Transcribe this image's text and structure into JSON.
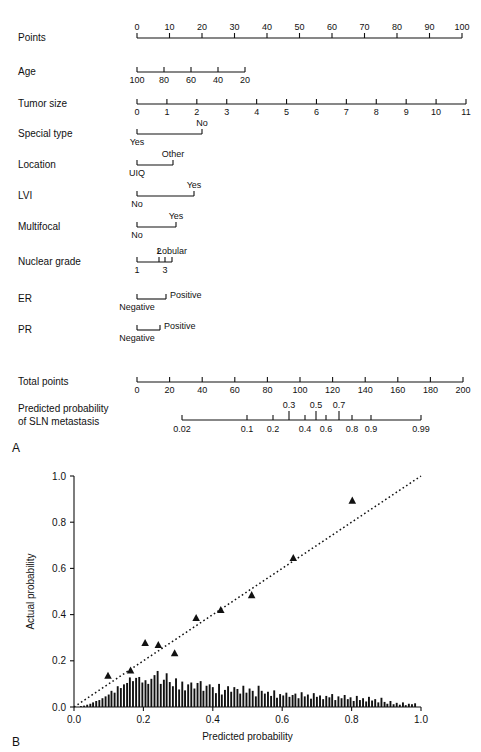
{
  "figure": {
    "panels": [
      {
        "letter": "A",
        "type": "nomogram"
      },
      {
        "letter": "B",
        "type": "calibration-plot"
      }
    ]
  },
  "nomogram": {
    "rows": [
      {
        "label": "Points",
        "kind": "continuous",
        "ticks": [
          "0",
          "10",
          "20",
          "30",
          "40",
          "50",
          "60",
          "70",
          "80",
          "90",
          "100"
        ],
        "tick_values": [
          0,
          10,
          20,
          30,
          40,
          50,
          60,
          70,
          80,
          90,
          100
        ],
        "axis_min": 0,
        "axis_max": 100,
        "label_side": "above",
        "x_start": 137,
        "x_end": 462
      },
      {
        "label": "Age",
        "kind": "continuous",
        "ticks": [
          "100",
          "80",
          "60",
          "40",
          "20"
        ],
        "tick_values": [
          100,
          80,
          60,
          40,
          20
        ],
        "axis_min": 100,
        "axis_max": 20,
        "label_side": "below",
        "x_start": 137,
        "x_end": 245
      },
      {
        "label": "Tumor size",
        "kind": "continuous",
        "ticks": [
          "0",
          "1",
          "2",
          "3",
          "4",
          "5",
          "6",
          "7",
          "8",
          "9",
          "10",
          "11"
        ],
        "tick_values": [
          0,
          1,
          2,
          3,
          4,
          5,
          6,
          7,
          8,
          9,
          10,
          11
        ],
        "axis_min": 0,
        "axis_max": 11,
        "label_side": "below",
        "x_start": 137,
        "x_end": 466
      },
      {
        "label": "Special type",
        "kind": "categorical",
        "categories": [
          {
            "name": "Yes",
            "x": 137,
            "side": "below"
          },
          {
            "name": "No",
            "x": 202,
            "side": "above"
          }
        ]
      },
      {
        "label": "Location",
        "kind": "categorical",
        "categories": [
          {
            "name": "UIQ",
            "x": 137,
            "side": "below"
          },
          {
            "name": "Other",
            "x": 173,
            "side": "above"
          }
        ]
      },
      {
        "label": "LVI",
        "kind": "categorical",
        "categories": [
          {
            "name": "No",
            "x": 137,
            "side": "below"
          },
          {
            "name": "Yes",
            "x": 194,
            "side": "above"
          }
        ]
      },
      {
        "label": "Multifocal",
        "kind": "categorical",
        "categories": [
          {
            "name": "No",
            "x": 137,
            "side": "below"
          },
          {
            "name": "Yes",
            "x": 176,
            "side": "above"
          }
        ]
      },
      {
        "label": "Nuclear grade",
        "kind": "categorical",
        "categories": [
          {
            "name": "1",
            "x": 137,
            "side": "below"
          },
          {
            "name": "2",
            "x": 159,
            "side": "above"
          },
          {
            "name": "3",
            "x": 165,
            "side": "below"
          },
          {
            "name": "Lobular",
            "x": 172,
            "side": "above"
          }
        ]
      },
      {
        "label": "ER",
        "kind": "categorical",
        "categories": [
          {
            "name": "Negative",
            "x": 137,
            "side": "below"
          },
          {
            "name": "Positive",
            "x": 166,
            "side": "right"
          }
        ]
      },
      {
        "label": "PR",
        "kind": "categorical",
        "categories": [
          {
            "name": "Negative",
            "x": 137,
            "side": "below"
          },
          {
            "name": "Positive",
            "x": 160,
            "side": "right"
          }
        ]
      },
      {
        "label": "Total points",
        "kind": "continuous",
        "ticks": [
          "0",
          "20",
          "40",
          "60",
          "80",
          "100",
          "120",
          "140",
          "160",
          "180",
          "200"
        ],
        "tick_values": [
          0,
          20,
          40,
          60,
          80,
          100,
          120,
          140,
          160,
          180,
          200
        ],
        "axis_min": 0,
        "axis_max": 200,
        "label_side": "below",
        "x_start": 137,
        "x_end": 463
      }
    ],
    "probability_axis": {
      "label_line1": "Predicted probability",
      "label_line2": "of SLN metastasis",
      "x_start": 182,
      "x_end": 421,
      "ticks_below": [
        {
          "text": "0.02",
          "x": 182
        },
        {
          "text": "0.1",
          "x": 247
        },
        {
          "text": "0.2",
          "x": 273
        },
        {
          "text": "0.4",
          "x": 305
        },
        {
          "text": "0.6",
          "x": 326
        },
        {
          "text": "0.8",
          "x": 352
        },
        {
          "text": "0.9",
          "x": 371
        },
        {
          "text": "0.99",
          "x": 421
        }
      ],
      "ticks_above": [
        {
          "text": "0.3",
          "x": 289
        },
        {
          "text": "0.5",
          "x": 316
        },
        {
          "text": "0.7",
          "x": 339
        }
      ]
    }
  },
  "chart_data": {
    "type": "scatter",
    "title": "",
    "xlabel": "Predicted probability",
    "ylabel": "Actual probability",
    "xlim": [
      0.0,
      1.0
    ],
    "ylim": [
      0.0,
      1.0
    ],
    "xticks": [
      0.0,
      0.2,
      0.4,
      0.6,
      0.8,
      1.0
    ],
    "xticklabels": [
      "0.0",
      "0.2",
      "0.4",
      "0.6",
      "0.8",
      "1.0"
    ],
    "yticks": [
      0.0,
      0.2,
      0.4,
      0.6,
      0.8,
      1.0
    ],
    "yticklabels": [
      "0.0",
      "0.2",
      "0.4",
      "0.6",
      "0.8",
      "1.0"
    ],
    "grid": false,
    "legend": "none",
    "reference_line": {
      "style": "dotted",
      "from": [
        0.0,
        0.0
      ],
      "to": [
        1.0,
        1.0
      ],
      "description": "ideal calibration diagonal"
    },
    "series": [
      {
        "name": "Observed vs predicted (deciles)",
        "marker": "triangle",
        "x": [
          0.098,
          0.163,
          0.205,
          0.243,
          0.29,
          0.352,
          0.423,
          0.512,
          0.632,
          0.802
        ],
        "y": [
          0.135,
          0.158,
          0.277,
          0.268,
          0.232,
          0.385,
          0.42,
          0.484,
          0.645,
          0.893
        ]
      }
    ],
    "histogram": {
      "name": "Distribution of predicted probabilities",
      "bin_width": 0.0088,
      "x": [
        0.02,
        0.029,
        0.038,
        0.047,
        0.055,
        0.064,
        0.073,
        0.082,
        0.091,
        0.1,
        0.108,
        0.117,
        0.126,
        0.135,
        0.144,
        0.153,
        0.161,
        0.17,
        0.179,
        0.188,
        0.197,
        0.206,
        0.214,
        0.223,
        0.232,
        0.241,
        0.25,
        0.259,
        0.267,
        0.276,
        0.285,
        0.294,
        0.303,
        0.312,
        0.32,
        0.329,
        0.338,
        0.347,
        0.356,
        0.365,
        0.373,
        0.382,
        0.391,
        0.4,
        0.409,
        0.418,
        0.426,
        0.435,
        0.444,
        0.453,
        0.462,
        0.471,
        0.479,
        0.488,
        0.497,
        0.506,
        0.515,
        0.524,
        0.532,
        0.541,
        0.55,
        0.559,
        0.568,
        0.577,
        0.585,
        0.594,
        0.603,
        0.612,
        0.621,
        0.63,
        0.638,
        0.647,
        0.656,
        0.665,
        0.674,
        0.683,
        0.691,
        0.7,
        0.709,
        0.718,
        0.727,
        0.736,
        0.744,
        0.753,
        0.762,
        0.771,
        0.78,
        0.789,
        0.797,
        0.806,
        0.815,
        0.824,
        0.833,
        0.842,
        0.85,
        0.859,
        0.868,
        0.877,
        0.886,
        0.895,
        0.903,
        0.912,
        0.921,
        0.93,
        0.939,
        0.948,
        0.956,
        0.965,
        0.974,
        0.983
      ],
      "y": [
        0.004,
        0.006,
        0.01,
        0.014,
        0.02,
        0.026,
        0.03,
        0.038,
        0.046,
        0.054,
        0.07,
        0.062,
        0.09,
        0.082,
        0.098,
        0.104,
        0.128,
        0.112,
        0.126,
        0.13,
        0.106,
        0.116,
        0.1,
        0.122,
        0.138,
        0.156,
        0.1,
        0.118,
        0.146,
        0.108,
        0.09,
        0.124,
        0.076,
        0.11,
        0.072,
        0.098,
        0.106,
        0.08,
        0.104,
        0.112,
        0.07,
        0.092,
        0.098,
        0.086,
        0.06,
        0.1,
        0.054,
        0.074,
        0.09,
        0.066,
        0.086,
        0.078,
        0.058,
        0.092,
        0.062,
        0.08,
        0.07,
        0.046,
        0.092,
        0.07,
        0.058,
        0.066,
        0.048,
        0.072,
        0.04,
        0.056,
        0.05,
        0.062,
        0.044,
        0.052,
        0.058,
        0.038,
        0.064,
        0.046,
        0.054,
        0.036,
        0.06,
        0.044,
        0.05,
        0.034,
        0.048,
        0.042,
        0.056,
        0.03,
        0.046,
        0.038,
        0.052,
        0.034,
        0.042,
        0.026,
        0.048,
        0.03,
        0.038,
        0.024,
        0.044,
        0.028,
        0.034,
        0.02,
        0.04,
        0.022,
        0.014,
        0.026,
        0.012,
        0.018,
        0.01,
        0.02,
        0.008,
        0.014,
        0.012,
        0.016
      ]
    }
  },
  "style": {
    "ink": "#111111",
    "axis": "#000000",
    "background": "#ffffff"
  }
}
